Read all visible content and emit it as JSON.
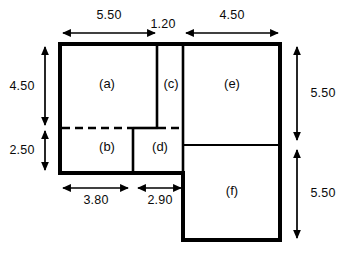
{
  "figure": {
    "type": "architectural-floor-plan",
    "stroke_color": "#000000",
    "background_color": "#ffffff"
  },
  "rooms": [
    {
      "id": "a",
      "label": "(a)"
    },
    {
      "id": "b",
      "label": "(b)"
    },
    {
      "id": "c",
      "label": "(c)"
    },
    {
      "id": "d",
      "label": "(d)"
    },
    {
      "id": "e",
      "label": "(e)"
    },
    {
      "id": "f",
      "label": "(f)"
    }
  ],
  "dimensions": {
    "top": [
      {
        "id": "top-1",
        "value": "5.50"
      },
      {
        "id": "top-2",
        "value": "1.20"
      },
      {
        "id": "top-3",
        "value": "4.50"
      }
    ],
    "left": [
      {
        "id": "left-1",
        "value": "4.50"
      },
      {
        "id": "left-2",
        "value": "2.50"
      }
    ],
    "right": [
      {
        "id": "right-1",
        "value": "5.50"
      },
      {
        "id": "right-2",
        "value": "5.50"
      }
    ],
    "bottom": [
      {
        "id": "bottom-1",
        "value": "3.80"
      },
      {
        "id": "bottom-2",
        "value": "2.90"
      }
    ]
  }
}
